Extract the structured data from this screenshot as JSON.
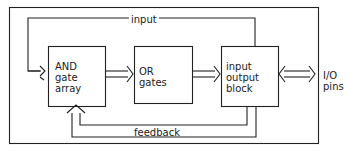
{
  "diagram": {
    "blocks": [
      {
        "id": "and",
        "lines": [
          "AND",
          "gate",
          "array"
        ]
      },
      {
        "id": "or",
        "lines": [
          "OR",
          "gates"
        ]
      },
      {
        "id": "io",
        "lines": [
          "input",
          "output",
          "block"
        ]
      }
    ],
    "labels": {
      "input": "input",
      "feedback": "feedback",
      "io_pins_1": "I/O",
      "io_pins_2": "pins"
    },
    "colors": {
      "stroke": "#222222",
      "background": "#ffffff"
    }
  }
}
